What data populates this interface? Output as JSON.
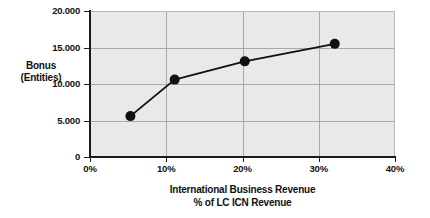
{
  "chart_data": {
    "type": "line",
    "title": "",
    "xlabel": "International Business Revenue\n% of LC ICN Revenue",
    "xlabel_line1": "International Business Revenue",
    "xlabel_line2": "% of LC ICN Revenue",
    "ylabel": "Bonus\n(Entities)",
    "ylabel_line1": "Bonus",
    "ylabel_line2": "(Entities)",
    "x": [
      5.3,
      11.1,
      20.3,
      32.1
    ],
    "values": [
      5600,
      10600,
      13100,
      15500
    ],
    "series": [
      {
        "name": "Bonus (Entities)",
        "x": [
          5.3,
          11.1,
          20.3,
          32.1
        ],
        "values": [
          5600,
          10600,
          13100,
          15500
        ]
      }
    ],
    "xlim": [
      0,
      40
    ],
    "ylim": [
      0,
      20000
    ],
    "xticks": [
      0,
      10,
      20,
      30,
      40
    ],
    "yticks": [
      0,
      5000,
      10000,
      15000,
      20000
    ],
    "xticklabels": [
      "0%",
      "10%",
      "20%",
      "30%",
      "40%"
    ],
    "yticklabels": [
      "0",
      "5.000",
      "10.000",
      "15.000",
      "20.000"
    ],
    "grid": true,
    "legend": false,
    "marker": "circle",
    "marker_color": "#111111",
    "line_color": "#111111",
    "plot_background": "#e9e9e9",
    "gridline_color": "#a9a9a9",
    "axis_color": "#1a1a1a"
  }
}
